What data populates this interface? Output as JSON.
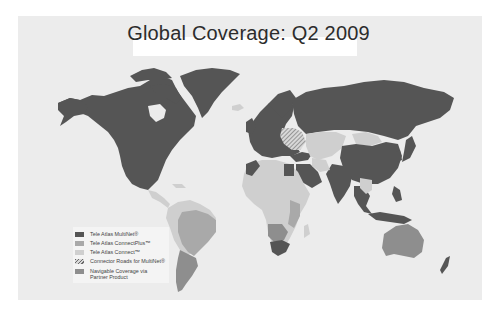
{
  "title": "Global Coverage: Q2 2009",
  "colors": {
    "background": "#ececec",
    "multinet": "#555555",
    "connectplus": "#a9a9a9",
    "connect": "#cfcfcf",
    "partner": "#8e8e8e",
    "ocean": "#ececec"
  },
  "legend": {
    "items": [
      {
        "label": "Tele Atlas MultiNet®",
        "swatch": "multinet"
      },
      {
        "label": "Tele Atlas ConnectPlus™",
        "swatch": "connectplus"
      },
      {
        "label": "Tele Atlas Connect™",
        "swatch": "connect"
      },
      {
        "label": "Connector Roads for MultiNet®",
        "swatch": "hatched"
      },
      {
        "label": "Navigable Coverage via",
        "label2": "Partner Product",
        "swatch": "partner"
      }
    ]
  },
  "regions": {
    "multinet": [
      "North America",
      "Greenland",
      "Europe",
      "Russia",
      "China",
      "India",
      "Japan",
      "Saudi Arabia",
      "Egypt",
      "South Africa",
      "Southeast Asia",
      "Turkey"
    ],
    "connectplus": [
      "Brazil",
      "Venezuela/Colombia",
      "Mozambique/Tanzania"
    ],
    "connect": [
      "Africa",
      "Central Asia",
      "Mongolia",
      "Central America",
      "Andean South America"
    ],
    "hatched": [
      "Ukraine/Belarus"
    ],
    "partner": [
      "Australia",
      "Argentina/Chile",
      "Southern Africa"
    ]
  }
}
